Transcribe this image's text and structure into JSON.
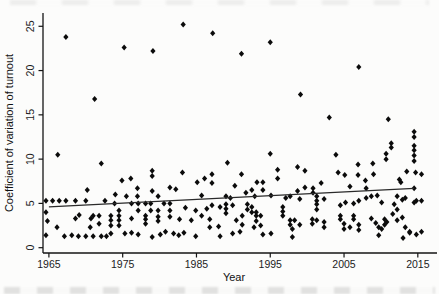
{
  "figure": {
    "background": "#fcfcfb",
    "ink_color": "#0b0b0b"
  },
  "chart_data": {
    "type": "scatter",
    "title": "",
    "xlabel": "Year",
    "ylabel": "Coefficient of variation of turnout",
    "x_ticks": [
      1965,
      1975,
      1985,
      1995,
      2005,
      2015
    ],
    "y_ticks": [
      0,
      5,
      10,
      15,
      20,
      25
    ],
    "xlim": [
      1964.2,
      2017.6
    ],
    "ylim": [
      -0.6,
      26.5
    ],
    "grid": false,
    "legend_position": "none",
    "marker": "diamond",
    "marker_color": "#0b0b0b",
    "trend_line": {
      "x1": 1965.0,
      "y1": 4.6,
      "x2": 2014.5,
      "y2": 6.7
    },
    "series": [
      {
        "name": "coefficient-of-variation-of-turnout",
        "points": [
          [
            1964.6,
            5.3
          ],
          [
            1964.6,
            4.0
          ],
          [
            1964.8,
            3.0
          ],
          [
            1964.6,
            1.4
          ],
          [
            1965.5,
            5.3
          ],
          [
            1966.1,
            2.3
          ],
          [
            1966.2,
            10.5
          ],
          [
            1966.4,
            5.3
          ],
          [
            1967.1,
            1.3
          ],
          [
            1967.3,
            23.8
          ],
          [
            1967.3,
            5.3
          ],
          [
            1968.1,
            1.4
          ],
          [
            1968.6,
            5.3
          ],
          [
            1968.6,
            3.3
          ],
          [
            1969.1,
            3.7
          ],
          [
            1969.0,
            1.3
          ],
          [
            1970.0,
            5.3
          ],
          [
            1970.0,
            1.3
          ],
          [
            1970.2,
            6.5
          ],
          [
            1970.6,
            2.3
          ],
          [
            1970.7,
            3.3
          ],
          [
            1971.0,
            3.6
          ],
          [
            1971.0,
            1.3
          ],
          [
            1971.2,
            16.8
          ],
          [
            1971.8,
            3.6
          ],
          [
            1971.8,
            2.7
          ],
          [
            1972.1,
            9.5
          ],
          [
            1972.1,
            1.3
          ],
          [
            1972.6,
            5.3
          ],
          [
            1972.8,
            1.3
          ],
          [
            1973.4,
            3.6
          ],
          [
            1973.4,
            3.1
          ],
          [
            1973.4,
            2.5
          ],
          [
            1973.4,
            1.6
          ],
          [
            1973.9,
            5.0
          ],
          [
            1974.0,
            6.0
          ],
          [
            1974.5,
            4.2
          ],
          [
            1974.5,
            3.6
          ],
          [
            1974.5,
            3.1
          ],
          [
            1974.5,
            2.5
          ],
          [
            1974.9,
            7.6
          ],
          [
            1975.2,
            22.6
          ],
          [
            1975.3,
            1.6
          ],
          [
            1975.5,
            5.8
          ],
          [
            1976.1,
            7.8
          ],
          [
            1976.2,
            5.0
          ],
          [
            1976.2,
            3.3
          ],
          [
            1976.2,
            1.7
          ],
          [
            1977.0,
            6.7
          ],
          [
            1977.0,
            5.8
          ],
          [
            1977.1,
            5.0
          ],
          [
            1977.1,
            4.2
          ],
          [
            1977.1,
            1.5
          ],
          [
            1978.1,
            5.0
          ],
          [
            1978.1,
            3.6
          ],
          [
            1978.1,
            3.2
          ],
          [
            1978.1,
            2.7
          ],
          [
            1978.8,
            5.0
          ],
          [
            1978.8,
            4.2
          ],
          [
            1979.0,
            8.7
          ],
          [
            1979.0,
            8.1
          ],
          [
            1979.0,
            6.4
          ],
          [
            1979.0,
            1.2
          ],
          [
            1979.1,
            22.2
          ],
          [
            1979.8,
            5.8
          ],
          [
            1979.8,
            4.2
          ],
          [
            1979.8,
            3.5
          ],
          [
            1979.8,
            3.0
          ],
          [
            1980.1,
            1.5
          ],
          [
            1980.6,
            5.0
          ],
          [
            1980.8,
            1.8
          ],
          [
            1981.4,
            6.8
          ],
          [
            1981.4,
            5.0
          ],
          [
            1981.4,
            4.2
          ],
          [
            1981.4,
            3.5
          ],
          [
            1981.9,
            1.6
          ],
          [
            1982.2,
            6.6
          ],
          [
            1982.6,
            1.4
          ],
          [
            1982.7,
            3.2
          ],
          [
            1983.1,
            8.5
          ],
          [
            1983.2,
            25.2
          ],
          [
            1983.3,
            1.7
          ],
          [
            1983.5,
            4.5
          ],
          [
            1984.3,
            3.1
          ],
          [
            1984.9,
            4.2
          ],
          [
            1984.9,
            1.3
          ],
          [
            1985.1,
            7.4
          ],
          [
            1985.7,
            5.9
          ],
          [
            1985.7,
            3.6
          ],
          [
            1986.1,
            7.8
          ],
          [
            1986.4,
            4.4
          ],
          [
            1986.8,
            3.2
          ],
          [
            1986.8,
            2.3
          ],
          [
            1987.1,
            8.3
          ],
          [
            1987.1,
            7.3
          ],
          [
            1987.1,
            4.8
          ],
          [
            1987.2,
            24.2
          ],
          [
            1988.0,
            2.4
          ],
          [
            1988.2,
            4.6
          ],
          [
            1988.2,
            1.3
          ],
          [
            1989.0,
            5.8
          ],
          [
            1989.0,
            4.9
          ],
          [
            1989.0,
            4.4
          ],
          [
            1989.0,
            3.9
          ],
          [
            1989.2,
            9.6
          ],
          [
            1989.6,
            5.6
          ],
          [
            1989.9,
            4.8
          ],
          [
            1989.9,
            1.6
          ],
          [
            1990.2,
            7.0
          ],
          [
            1990.4,
            3.1
          ],
          [
            1990.9,
            1.8
          ],
          [
            1991.1,
            8.3
          ],
          [
            1991.1,
            21.9
          ],
          [
            1991.2,
            3.6
          ],
          [
            1991.2,
            2.6
          ],
          [
            1991.7,
            6.2
          ],
          [
            1991.9,
            4.9
          ],
          [
            1991.9,
            4.3
          ],
          [
            1992.5,
            6.5
          ],
          [
            1992.5,
            4.6
          ],
          [
            1992.5,
            4.0
          ],
          [
            1992.8,
            2.3
          ],
          [
            1992.9,
            5.8
          ],
          [
            1993.1,
            4.0
          ],
          [
            1993.1,
            3.6
          ],
          [
            1993.1,
            3.0
          ],
          [
            1993.2,
            7.4
          ],
          [
            1993.7,
            3.6
          ],
          [
            1993.7,
            2.5
          ],
          [
            1994.0,
            7.4
          ],
          [
            1994.0,
            6.5
          ],
          [
            1994.0,
            1.5
          ],
          [
            1995.0,
            23.2
          ],
          [
            1995.0,
            10.6
          ],
          [
            1995.1,
            5.9
          ],
          [
            1995.1,
            1.6
          ],
          [
            1996.0,
            8.8
          ],
          [
            1996.0,
            7.8
          ],
          [
            1996.7,
            4.6
          ],
          [
            1996.7,
            4.1
          ],
          [
            1996.7,
            3.6
          ],
          [
            1997.1,
            5.6
          ],
          [
            1997.7,
            5.8
          ],
          [
            1997.7,
            3.1
          ],
          [
            1997.7,
            2.6
          ],
          [
            1998.0,
            2.1
          ],
          [
            1998.0,
            1.2
          ],
          [
            1998.3,
            3.1
          ],
          [
            1998.7,
            9.1
          ],
          [
            1998.7,
            6.4
          ],
          [
            1999.0,
            5.5
          ],
          [
            1999.0,
            2.6
          ],
          [
            1999.1,
            17.3
          ],
          [
            1999.7,
            8.7
          ],
          [
            1999.7,
            6.8
          ],
          [
            2000.7,
            2.7
          ],
          [
            2000.7,
            3.2
          ],
          [
            2000.8,
            6.7
          ],
          [
            2000.8,
            6.2
          ],
          [
            2001.3,
            5.8
          ],
          [
            2001.3,
            5.3
          ],
          [
            2001.3,
            4.9
          ],
          [
            2001.3,
            4.3
          ],
          [
            2001.3,
            3.1
          ],
          [
            2001.9,
            7.3
          ],
          [
            2002.3,
            5.5
          ],
          [
            2002.3,
            2.9
          ],
          [
            2002.3,
            2.3
          ],
          [
            2003.0,
            14.7
          ],
          [
            2003.9,
            10.5
          ],
          [
            2004.2,
            8.5
          ],
          [
            2004.5,
            4.8
          ],
          [
            2004.5,
            3.6
          ],
          [
            2004.5,
            3.2
          ],
          [
            2005.0,
            2.7
          ],
          [
            2005.0,
            2.1
          ],
          [
            2005.1,
            8.2
          ],
          [
            2005.2,
            5.1
          ],
          [
            2005.8,
            6.9
          ],
          [
            2005.8,
            2.3
          ],
          [
            2006.3,
            5.0
          ],
          [
            2006.3,
            3.6
          ],
          [
            2006.3,
            3.2
          ],
          [
            2006.9,
            9.4
          ],
          [
            2006.9,
            8.2
          ],
          [
            2007.0,
            20.4
          ],
          [
            2007.0,
            5.3
          ],
          [
            2007.0,
            2.6
          ],
          [
            2007.0,
            2.0
          ],
          [
            2007.9,
            7.6
          ],
          [
            2008.0,
            6.7
          ],
          [
            2008.0,
            5.6
          ],
          [
            2008.7,
            5.8
          ],
          [
            2008.7,
            3.3
          ],
          [
            2008.9,
            9.5
          ],
          [
            2009.0,
            8.3
          ],
          [
            2009.3,
            2.8
          ],
          [
            2009.5,
            5.9
          ],
          [
            2009.7,
            2.3
          ],
          [
            2009.7,
            1.4
          ],
          [
            2010.1,
            5.1
          ],
          [
            2010.1,
            2.1
          ],
          [
            2010.5,
            3.2
          ],
          [
            2010.5,
            2.6
          ],
          [
            2010.7,
            10.6
          ],
          [
            2010.7,
            10.0
          ],
          [
            2010.8,
            2.9
          ],
          [
            2011.0,
            14.5
          ],
          [
            2011.4,
            11.8
          ],
          [
            2011.4,
            11.3
          ],
          [
            2011.6,
            3.8
          ],
          [
            2011.8,
            4.9
          ],
          [
            2012.2,
            5.8
          ],
          [
            2012.2,
            4.3
          ],
          [
            2012.2,
            3.1
          ],
          [
            2012.5,
            7.7
          ],
          [
            2012.7,
            7.4
          ],
          [
            2012.9,
            5.4
          ],
          [
            2012.9,
            3.4
          ],
          [
            2013.0,
            1.1
          ],
          [
            2013.3,
            5.6
          ],
          [
            2013.3,
            2.3
          ],
          [
            2013.5,
            8.6
          ],
          [
            2013.9,
            1.8
          ],
          [
            2013.9,
            1.7
          ],
          [
            2014.5,
            13.1
          ],
          [
            2014.5,
            12.5
          ],
          [
            2014.5,
            11.5
          ],
          [
            2014.5,
            11.0
          ],
          [
            2014.5,
            10.4
          ],
          [
            2014.5,
            9.8
          ],
          [
            2014.7,
            8.5
          ],
          [
            2014.5,
            6.7
          ],
          [
            2014.8,
            5.3
          ],
          [
            2014.5,
            5.1
          ],
          [
            2014.8,
            1.5
          ],
          [
            2015.5,
            8.3
          ],
          [
            2015.5,
            5.3
          ],
          [
            2015.5,
            1.8
          ]
        ]
      }
    ]
  }
}
